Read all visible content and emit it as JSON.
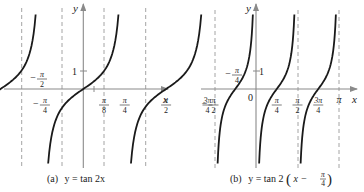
{
  "figure": {
    "panel_a": {
      "caption_prefix": "(a)",
      "caption_eq": "y = tan 2x",
      "x_axis_label": "x",
      "y_axis_label": "y",
      "y_tick_label": "1",
      "x_tick_labels": [
        {
          "sign": "−",
          "num": "3π",
          "den": "4",
          "value": -0.75
        },
        {
          "sign": "−",
          "num": "π",
          "den": "4",
          "value": -0.25
        },
        {
          "sign": "",
          "num": "π",
          "den": "8",
          "value": 0.125
        },
        {
          "sign": "",
          "num": "π",
          "den": "4",
          "value": 0.25
        },
        {
          "sign": "",
          "num": "π",
          "den": "2",
          "value": 0.5
        },
        {
          "sign": "",
          "num": "3π",
          "den": "4",
          "value": 0.75
        }
      ],
      "annotation": {
        "sign": "−",
        "num": "π",
        "den": "2"
      },
      "asymptotes_pi_units": [
        -0.75,
        -0.25,
        0.25,
        0.75
      ]
    },
    "panel_b": {
      "caption_prefix": "(b)",
      "caption_eq_left": "y = tan 2",
      "caption_eq_inner": "x −",
      "caption_frac_num": "π",
      "caption_frac_den": "4",
      "x_axis_label": "x",
      "y_axis_label": "y",
      "y_tick_label": "1",
      "origin_label": "0",
      "x_tick_labels": [
        {
          "sign": "−",
          "num": "π",
          "den": "2",
          "value": -0.5
        },
        {
          "sign": "",
          "num": "π",
          "den": "4",
          "value": 0.25
        },
        {
          "sign": "",
          "num": "π",
          "den": "2",
          "value": 0.5
        },
        {
          "sign": "",
          "num": "3π",
          "den": "4",
          "value": 0.75
        },
        {
          "sign": "",
          "num": "π",
          "den": "",
          "value": 1.0
        }
      ],
      "annotation": {
        "sign": "−",
        "num": "π",
        "den": "4"
      },
      "asymptotes_pi_units": [
        -0.5,
        0,
        0.5,
        1.0
      ]
    }
  },
  "chart_data": [
    {
      "type": "line",
      "title": "(a) y = tan 2x",
      "xlabel": "x",
      "ylabel": "y",
      "function": "tan(2x)",
      "period": "π/2",
      "asymptotes": [
        "-3π/4",
        "-π/4",
        "π/4",
        "3π/4"
      ],
      "zeros": [
        "-π/2",
        "0",
        "π/2"
      ],
      "x_ticks": [
        "-3π/4",
        "-π/4",
        "π/8",
        "π/4",
        "π/2",
        "3π/4"
      ],
      "y_ticks": [
        1
      ],
      "points": [
        {
          "x": "π/8",
          "y": 1
        }
      ],
      "grid": false
    },
    {
      "type": "line",
      "title": "(b) y = tan 2(x − π/4)",
      "xlabel": "x",
      "ylabel": "y",
      "function": "tan(2(x - π/4))",
      "period": "π/2",
      "asymptotes": [
        "-π/2",
        "0",
        "π/2",
        "π"
      ],
      "zeros": [
        "-π/4",
        "π/4",
        "3π/4"
      ],
      "x_ticks": [
        "-π/2",
        "0",
        "π/4",
        "π/2",
        "3π/4",
        "π"
      ],
      "y_ticks": [
        1
      ],
      "grid": false
    }
  ]
}
